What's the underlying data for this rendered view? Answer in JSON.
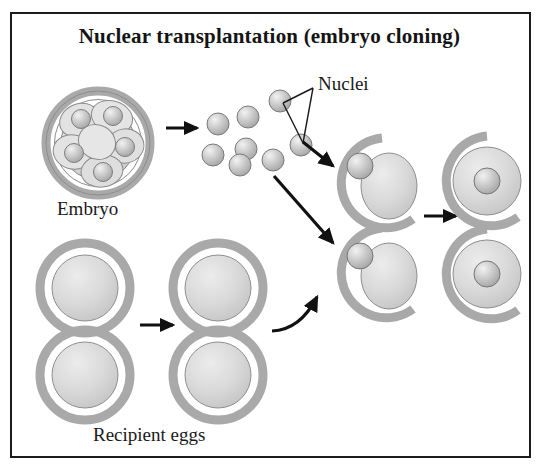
{
  "figure": {
    "title": "Nuclear transplantation (embryo cloning)",
    "border_color": "#1b1b1b",
    "background_color": "#ffffff"
  },
  "labels": {
    "embryo": "Embryo",
    "nuclei": "Nuclei",
    "recipient_eggs": "Recipient eggs"
  },
  "colors": {
    "zona_pellucida": "#a9a9a9",
    "zona_pellucida_dark": "#8f8f8f",
    "cytoplasm": "#d6d6d6",
    "cytoplasm_light": "#e6e6e6",
    "nucleus": "#bdbdbd",
    "nucleus_highlight": "#ededed",
    "outline": "#6f6f6f",
    "arrow": "#111111",
    "text": "#141414"
  },
  "diagram": {
    "type": "process-diagram",
    "stages": [
      {
        "name": "embryo",
        "label": "Embryo",
        "description": "Multicellular morula embryo inside a complete zona pellucida ring; each blastomere contains a nucleus",
        "center": [
          98,
          143
        ],
        "zona_outer_radius": 52,
        "zona_inner_radius": 43,
        "blastomere_count": 8,
        "visible_nuclei": 5
      },
      {
        "name": "isolated-nuclei",
        "label": "Nuclei",
        "description": "Eight nuclei isolated from the embryo blastomeres",
        "count": 8,
        "nucleus_radius": 11,
        "positions": [
          [
            218,
            124
          ],
          [
            248,
            117
          ],
          [
            279,
            101
          ],
          [
            213,
            155
          ],
          [
            245,
            149
          ],
          [
            240,
            163
          ],
          [
            273,
            158
          ],
          [
            301,
            145
          ]
        ]
      },
      {
        "name": "recipient-eggs-column-1",
        "label": "Recipient eggs",
        "description": "Enucleated recipient eggs with intact zona pellucida",
        "count": 2,
        "centers": [
          [
            85,
            288
          ],
          [
            85,
            375
          ]
        ],
        "zona_outer_radius": 45,
        "cytoplasm_radius": 34
      },
      {
        "name": "recipient-eggs-column-2",
        "label": "Recipient eggs",
        "description": "Enucleated recipient eggs prepared for transfer",
        "count": 2,
        "centers": [
          [
            218,
            288
          ],
          [
            218,
            375
          ]
        ],
        "zona_outer_radius": 45,
        "cytoplasm_radius": 34
      },
      {
        "name": "nucleus-insertion",
        "description": "Donor nucleus inserted into enucleated egg through opened zona pellucida",
        "count": 2,
        "centers": [
          [
            382,
            183
          ],
          [
            382,
            272
          ]
        ],
        "zona_gap_degrees": 70
      },
      {
        "name": "reconstructed-embryos",
        "description": "Reconstructed cloned embryos: donor nucleus fused into egg cytoplasm, nucleus centered",
        "count": 2,
        "centers": [
          [
            487,
            181
          ],
          [
            487,
            274
          ]
        ],
        "cytoplasm_radius": 35,
        "nucleus_radius": 13
      }
    ],
    "arrows": [
      {
        "name": "embryo-to-nuclei",
        "from": [
          166,
          128
        ],
        "to": [
          199,
          128
        ],
        "style": "straight"
      },
      {
        "name": "nuclei-to-upper-egg",
        "from": [
          302,
          141
        ],
        "to": [
          333,
          165
        ],
        "style": "straight"
      },
      {
        "name": "nuclei-to-lower-egg",
        "from": [
          276,
          176
        ],
        "to": [
          333,
          241
        ],
        "style": "straight"
      },
      {
        "name": "egg-column1-to-column2",
        "from": [
          140,
          325
        ],
        "to": [
          175,
          325
        ],
        "style": "straight"
      },
      {
        "name": "eggs-to-insertion",
        "from": [
          276,
          327
        ],
        "to": [
          320,
          294
        ],
        "style": "curved"
      },
      {
        "name": "insertion-to-reconstructed",
        "from": [
          424,
          215
        ],
        "to": [
          458,
          215
        ],
        "style": "straight"
      }
    ],
    "leader_lines": {
      "name": "nuclei-callout",
      "apex": [
        313,
        88
      ],
      "targets": [
        [
          281,
          101
        ],
        [
          301,
          145
        ]
      ]
    }
  }
}
